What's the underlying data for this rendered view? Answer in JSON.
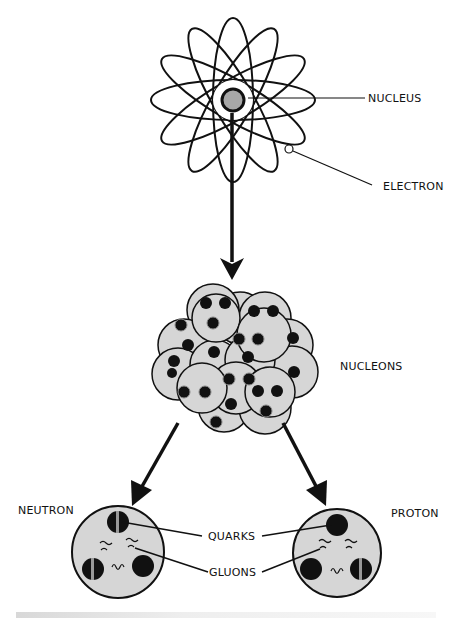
{
  "diagram": {
    "type": "atomic-structure",
    "labels": {
      "nucleus": "NUCLEUS",
      "electron": "ELECTRON",
      "nucleons": "NUCLEONS",
      "neutron": "NEUTRON",
      "proton": "PROTON",
      "quarks": "QUARKS",
      "gluons": "GLUONS"
    },
    "colors": {
      "nucleon_fill": "#d6d6d6",
      "nucleus_fill": "#a8a8a8",
      "stroke": "#111111",
      "background": "#ffffff"
    },
    "stages": [
      "atom",
      "nucleus (nucleons)",
      "neutron / proton (quarks & gluons)"
    ]
  }
}
